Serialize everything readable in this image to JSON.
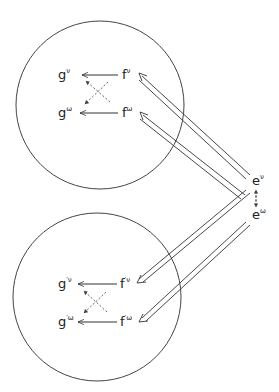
{
  "diagram": {
    "top_cluster": {
      "nodes": {
        "g_v": {
          "base": "g",
          "sup": "ν"
        },
        "f_v": {
          "base": "f",
          "sup": "ν"
        },
        "g_w": {
          "base": "g",
          "sup": "ω"
        },
        "f_w": {
          "base": "f",
          "sup": "ω"
        }
      }
    },
    "bottom_cluster": {
      "nodes": {
        "g_v": {
          "base": "g",
          "sup": "′ν"
        },
        "f_v": {
          "base": "f",
          "sup": "′ν"
        },
        "g_w": {
          "base": "g",
          "sup": "′ω"
        },
        "f_w": {
          "base": "f",
          "sup": "′ω"
        }
      }
    },
    "sources": {
      "e_v": {
        "base": "e",
        "sup": "ν"
      },
      "e_w": {
        "base": "e",
        "sup": "ω"
      }
    },
    "colors": {
      "stroke": "#333333",
      "text": "#222222"
    }
  }
}
